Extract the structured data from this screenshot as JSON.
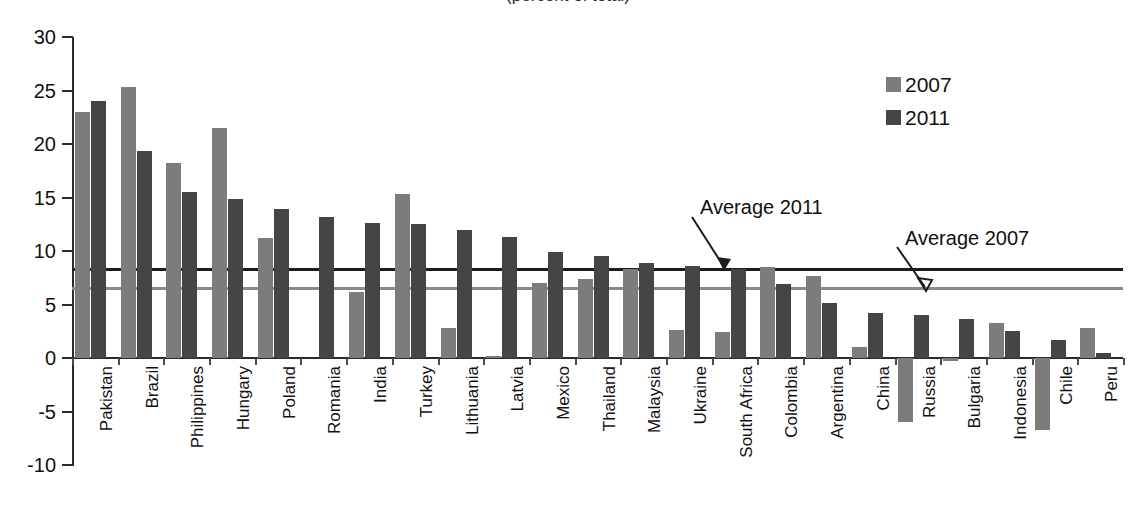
{
  "chart_data": {
    "type": "bar",
    "title": "(percent of total)",
    "xlabel": "",
    "ylabel": "",
    "ylim": [
      -10,
      30
    ],
    "yticks": [
      30,
      25,
      20,
      15,
      10,
      5,
      0,
      -5,
      -10
    ],
    "grid": false,
    "legend_position": "top-right",
    "categories": [
      "Pakistan",
      "Brazil",
      "Philippines",
      "Hungary",
      "Poland",
      "Romania",
      "India",
      "Turkey",
      "Lithuania",
      "Latvia",
      "Mexico",
      "Thailand",
      "Malaysia",
      "Ukraine",
      "South Africa",
      "Colombia",
      "Argentina",
      "China",
      "Russia",
      "Bulgaria",
      "Indonesia",
      "Chile",
      "Peru"
    ],
    "series": [
      {
        "name": "2007",
        "color": "#7c7c7c",
        "values": [
          23.0,
          25.3,
          18.2,
          21.5,
          11.2,
          0,
          6.2,
          15.3,
          2.8,
          0.2,
          7.0,
          7.4,
          8.3,
          2.6,
          2.4,
          8.5,
          7.7,
          1.0,
          -6.0,
          -0.3,
          3.3,
          -6.7,
          2.8
        ]
      },
      {
        "name": "2011",
        "color": "#454545",
        "values": [
          24.0,
          19.3,
          15.5,
          14.9,
          13.9,
          13.2,
          12.6,
          12.5,
          12.0,
          11.3,
          9.9,
          9.5,
          8.9,
          8.6,
          8.3,
          6.9,
          5.1,
          4.2,
          4.0,
          3.6,
          2.5,
          1.7,
          0.5
        ]
      }
    ],
    "reference_lines": [
      {
        "name": "Average 2011",
        "value": 8.3,
        "color": "#1d1d1d"
      },
      {
        "name": "Average 2007",
        "value": 6.5,
        "color": "#8a8a8a"
      }
    ],
    "annotations": [
      {
        "text": "Average 2011"
      },
      {
        "text": "Average 2007"
      }
    ]
  },
  "legend": {
    "items": [
      {
        "label": "2007"
      },
      {
        "label": "2011"
      }
    ]
  }
}
